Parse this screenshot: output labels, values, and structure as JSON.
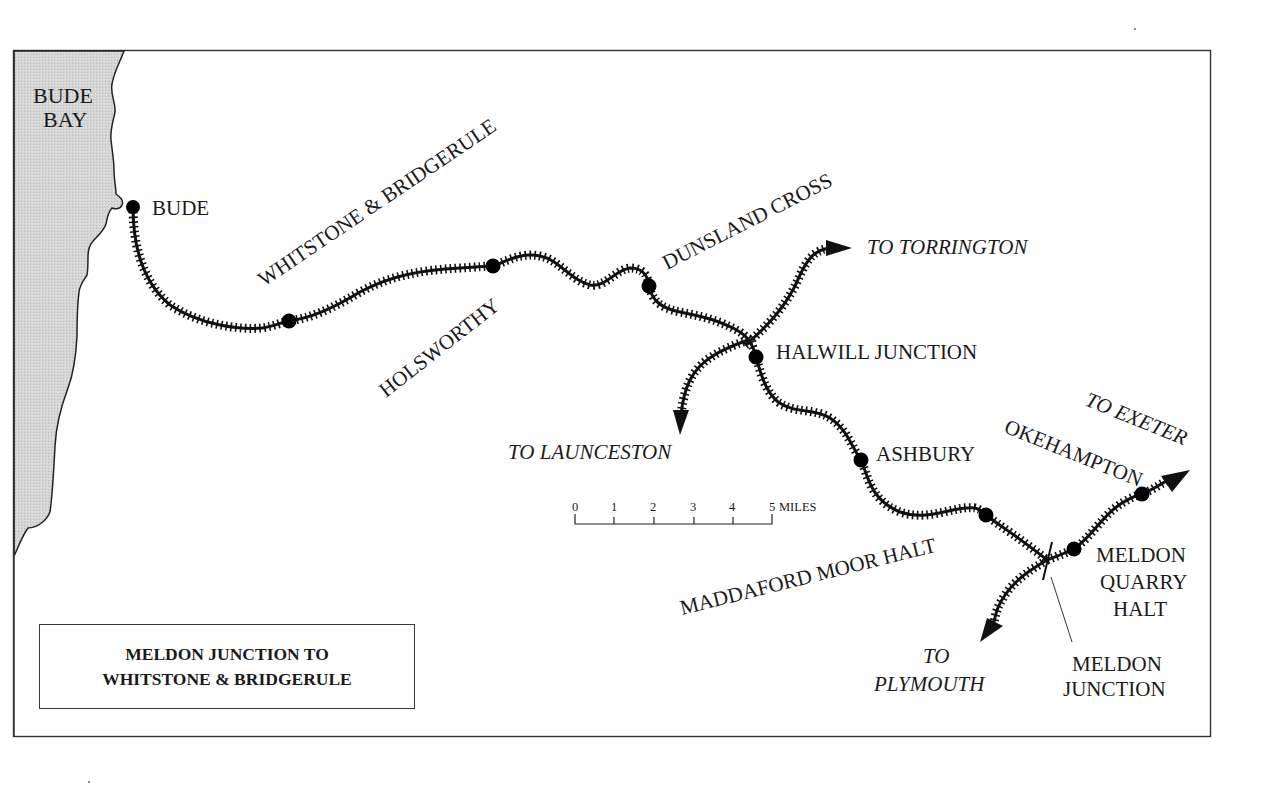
{
  "map": {
    "title_line1": "MELDON JUNCTION TO",
    "title_line2": "WHITSTONE & BRIDGERULE",
    "sea": {
      "label_line1": "BUDE",
      "label_line2": "BAY",
      "fill": "#d4d4d4"
    },
    "colors": {
      "track": "#111111",
      "border": "#333333",
      "text": "#1a1a1a"
    },
    "stations": [
      {
        "id": "bude",
        "label": "BUDE",
        "x": 133,
        "y": 207
      },
      {
        "id": "whitstone-bridgerule",
        "label": "WHITSTONE & BRIDGERULE",
        "x": 289,
        "y": 321
      },
      {
        "id": "holsworthy",
        "label": "HOLSWORTHY",
        "x": 493,
        "y": 266
      },
      {
        "id": "dunsland-cross",
        "label": "DUNSLAND CROSS",
        "x": 649,
        "y": 286
      },
      {
        "id": "halwill-junction",
        "label": "HALWILL JUNCTION",
        "x": 756,
        "y": 357
      },
      {
        "id": "ashbury",
        "label": "ASHBURY",
        "x": 861,
        "y": 460
      },
      {
        "id": "maddaford-moor-halt",
        "label": "MADDAFORD MOOR HALT",
        "x": 986,
        "y": 515
      },
      {
        "id": "meldon-quarry-halt",
        "label_line1": "MELDON",
        "label_line2": "QUARRY",
        "label_line3": "HALT",
        "x": 1074,
        "y": 549
      },
      {
        "id": "okehampton",
        "label": "OKEHAMPTON",
        "x": 1142,
        "y": 494
      }
    ],
    "junction": {
      "label_line1": "MELDON",
      "label_line2": "JUNCTION",
      "x": 1047,
      "y": 560
    },
    "destinations": {
      "torrington": "TO TORRINGTON",
      "launceston": "TO LAUNCESTON",
      "exeter": "TO EXETER",
      "plymouth_line1": "TO",
      "plymouth_line2": "PLYMOUTH"
    },
    "scale_bar": {
      "ticks": [
        "0",
        "1",
        "2",
        "3",
        "4",
        "5"
      ],
      "unit": "MILES"
    }
  }
}
